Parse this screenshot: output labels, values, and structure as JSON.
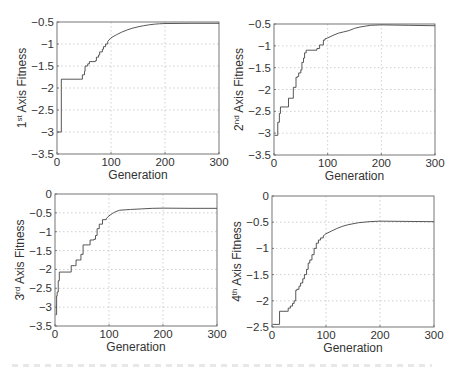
{
  "figure": {
    "caption_visible": false
  },
  "chart_data": [
    {
      "type": "line",
      "title": "",
      "xlabel": "Generation",
      "ylabel": "1st Axis Fitness",
      "ylabel_parts": {
        "num": "1",
        "sup": "st",
        "rest": " Axis Fitness"
      },
      "xlim": [
        0,
        300
      ],
      "ylim": [
        -3.5,
        -0.5
      ],
      "xticks": [
        0,
        100,
        200,
        300
      ],
      "yticks": [
        -3.5,
        -3,
        -2.5,
        -2,
        -1.5,
        -1,
        -0.5
      ],
      "ytick_labels": [
        "-3.5",
        "-3",
        "-2.5",
        "-2",
        "-1.5",
        "-1",
        "-0.5"
      ],
      "grid": true,
      "box": {
        "left": 57,
        "top": 22,
        "right": 219,
        "bottom": 154
      },
      "series": [
        {
          "name": "fitness",
          "x": [
            1,
            8,
            8,
            44,
            47,
            51,
            52,
            57,
            60,
            71,
            73,
            77,
            79,
            84,
            86,
            90,
            94,
            100,
            110,
            120,
            130,
            140,
            150,
            160,
            170,
            180,
            190,
            200,
            250,
            300
          ],
          "y": [
            -3.0,
            -3.0,
            -1.8,
            -1.8,
            -1.7,
            -1.62,
            -1.5,
            -1.45,
            -1.4,
            -1.38,
            -1.3,
            -1.25,
            -1.18,
            -1.12,
            -1.06,
            -1.0,
            -0.94,
            -0.86,
            -0.79,
            -0.73,
            -0.68,
            -0.64,
            -0.61,
            -0.585,
            -0.565,
            -0.55,
            -0.54,
            -0.535,
            -0.53,
            -0.53
          ]
        }
      ]
    },
    {
      "type": "line",
      "title": "",
      "xlabel": "Generation",
      "ylabel": "2nd Axis Fitness",
      "ylabel_parts": {
        "num": "2",
        "sup": "nd",
        "rest": " Axis Fitness"
      },
      "xlim": [
        0,
        300
      ],
      "ylim": [
        -3.5,
        -0.5
      ],
      "xticks": [
        0,
        100,
        200,
        300
      ],
      "yticks": [
        -3.5,
        -3,
        -2.5,
        -2,
        -1.5,
        -1,
        -0.5
      ],
      "ytick_labels": [
        "-3.5",
        "-3",
        "-2.5",
        "-2",
        "-1.5",
        "-1",
        "-0.5"
      ],
      "grid": true,
      "box": {
        "left": 274,
        "top": 24,
        "right": 435,
        "bottom": 155
      },
      "series": [
        {
          "name": "fitness",
          "x": [
            1,
            6,
            7,
            10,
            12,
            24,
            27,
            33,
            36,
            39,
            41,
            44,
            46,
            50,
            52,
            55,
            57,
            60,
            63,
            80,
            85,
            92,
            95,
            100,
            110,
            120,
            130,
            140,
            150,
            160,
            170,
            180,
            200,
            250,
            300
          ],
          "y": [
            -3.05,
            -3.05,
            -2.75,
            -2.55,
            -2.4,
            -2.4,
            -2.2,
            -2.2,
            -1.95,
            -1.95,
            -1.72,
            -1.7,
            -1.62,
            -1.55,
            -1.38,
            -1.28,
            -1.16,
            -1.1,
            -1.1,
            -1.06,
            -0.98,
            -0.87,
            -0.84,
            -0.82,
            -0.76,
            -0.71,
            -0.68,
            -0.65,
            -0.6,
            -0.57,
            -0.55,
            -0.53,
            -0.52,
            -0.53,
            -0.54
          ]
        }
      ]
    },
    {
      "type": "line",
      "title": "",
      "xlabel": "Generation",
      "ylabel": "3rd Axis Fitness",
      "ylabel_parts": {
        "num": "3",
        "sup": "rd",
        "rest": " Axis Fitness"
      },
      "xlim": [
        0,
        300
      ],
      "ylim": [
        -3.5,
        0
      ],
      "xticks": [
        0,
        100,
        200,
        300
      ],
      "yticks": [
        -3.5,
        -3,
        -2.5,
        -2,
        -1.5,
        -1,
        -0.5,
        0
      ],
      "ytick_labels": [
        "-3.5",
        "-3",
        "-2.5",
        "-2",
        "-1.5",
        "-1",
        "-0.5",
        "0"
      ],
      "grid": true,
      "box": {
        "left": 55,
        "top": 194,
        "right": 217,
        "bottom": 326
      },
      "series": [
        {
          "name": "fitness",
          "x": [
            1,
            3,
            4,
            6,
            8,
            28,
            30,
            36,
            39,
            45,
            48,
            52,
            62,
            65,
            72,
            75,
            78,
            82,
            88,
            95,
            100,
            106,
            112,
            120,
            140,
            160,
            180,
            200,
            250,
            300
          ],
          "y": [
            -3.2,
            -2.7,
            -2.6,
            -2.3,
            -2.07,
            -2.07,
            -1.9,
            -1.9,
            -1.75,
            -1.75,
            -1.6,
            -1.35,
            -1.35,
            -1.22,
            -1.2,
            -1.1,
            -0.92,
            -0.8,
            -0.68,
            -0.65,
            -0.58,
            -0.52,
            -0.47,
            -0.43,
            -0.41,
            -0.395,
            -0.38,
            -0.375,
            -0.38,
            -0.38
          ]
        }
      ]
    },
    {
      "type": "line",
      "title": "",
      "xlabel": "Generation",
      "ylabel": "4th Axis Fitness",
      "ylabel_parts": {
        "num": "4",
        "sup": "th",
        "rest": " Axis Fitness"
      },
      "xlim": [
        0,
        300
      ],
      "ylim": [
        -2.5,
        0
      ],
      "xticks": [
        0,
        100,
        200,
        300
      ],
      "yticks": [
        -2.5,
        -2,
        -1.5,
        -1,
        -0.5,
        0
      ],
      "ytick_labels": [
        "-2.5",
        "-2",
        "-1.5",
        "-1",
        "-0.5",
        "0"
      ],
      "grid": true,
      "box": {
        "left": 272,
        "top": 196,
        "right": 434,
        "bottom": 327
      },
      "series": [
        {
          "name": "fitness",
          "x": [
            1,
            14,
            14,
            28,
            30,
            34,
            38,
            41,
            44,
            46,
            50,
            53,
            57,
            60,
            64,
            67,
            70,
            74,
            78,
            82,
            86,
            90,
            95,
            100,
            110,
            120,
            130,
            140,
            150,
            160,
            180,
            200,
            250,
            300
          ],
          "y": [
            -2.45,
            -2.45,
            -2.2,
            -2.2,
            -2.14,
            -2.1,
            -2.05,
            -2.0,
            -1.8,
            -1.78,
            -1.72,
            -1.66,
            -1.58,
            -1.5,
            -1.4,
            -1.28,
            -1.22,
            -1.12,
            -1.0,
            -0.9,
            -0.84,
            -0.8,
            -0.76,
            -0.72,
            -0.67,
            -0.62,
            -0.58,
            -0.55,
            -0.53,
            -0.51,
            -0.49,
            -0.48,
            -0.485,
            -0.49
          ]
        }
      ]
    }
  ]
}
